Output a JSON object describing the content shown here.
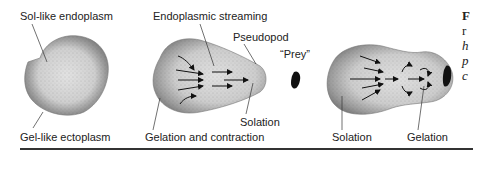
{
  "figure": {
    "panels": [
      {
        "id": "resting-amoeba",
        "labels": {
          "top": "Sol-like endoplasm",
          "bottom": "Gel-like ectoplasm"
        }
      },
      {
        "id": "pseudopod-extension",
        "labels": {
          "top": "Endoplasmic streaming",
          "pseudopod": "Pseudopod",
          "tip": "Solation",
          "bottom": "Gelation and contraction"
        }
      },
      {
        "id": "prey-marker",
        "labels": {
          "prey": "“Prey”"
        }
      },
      {
        "id": "engulfing",
        "labels": {
          "left": "Solation",
          "right": "Gelation"
        }
      }
    ],
    "caption_fragment": {
      "line1": "F",
      "line2": "r",
      "line3": "h",
      "line4": "p",
      "line5": "c"
    },
    "colors": {
      "ectoplasm": "#8a8a8a",
      "endoplasm": "#d8d8d8",
      "prey": "#111111",
      "ink": "#222222"
    }
  }
}
